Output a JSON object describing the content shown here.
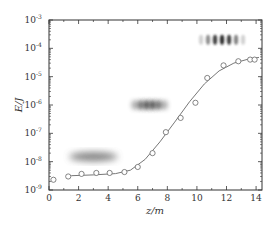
{
  "chart_data": {
    "type": "scatter",
    "title": "",
    "xlabel": "z/m",
    "ylabel": "E/J",
    "xlim": [
      0,
      14.4
    ],
    "ylim": [
      1e-09,
      0.001
    ],
    "yscale": "log",
    "grid": false,
    "legend": null,
    "x_ticks": [
      0,
      2,
      4,
      6,
      8,
      10,
      12,
      14
    ],
    "x_tick_labels": [
      "0",
      "2",
      "4",
      "6",
      "8",
      "10",
      "12",
      "14"
    ],
    "y_ticks": [
      1e-09,
      1e-08,
      1e-07,
      1e-06,
      1e-05,
      0.0001,
      0.001
    ],
    "y_tick_labels": [
      {
        "base": "10",
        "exp": "-9"
      },
      {
        "base": "10",
        "exp": "-8"
      },
      {
        "base": "10",
        "exp": "-7"
      },
      {
        "base": "10",
        "exp": "-6"
      },
      {
        "base": "10",
        "exp": "-5"
      },
      {
        "base": "10",
        "exp": "-4"
      },
      {
        "base": "10",
        "exp": "-3"
      }
    ],
    "series": [
      {
        "name": "measured",
        "style": "open-circle",
        "x": [
          0.3,
          1.3,
          2.2,
          3.2,
          4.1,
          5.1,
          6.0,
          7.0,
          7.9,
          8.9,
          9.9,
          10.7,
          11.8,
          12.8,
          13.6,
          13.9
        ],
        "y": [
          2.3e-09,
          3e-09,
          3.7e-09,
          4e-09,
          4e-09,
          4.3e-09,
          6.5e-09,
          2e-08,
          1.1e-07,
          3.5e-07,
          1.2e-06,
          9e-06,
          2.5e-05,
          3.5e-05,
          4e-05,
          4e-05
        ]
      },
      {
        "name": "simulation",
        "style": "line",
        "x": [
          1.5,
          3,
          4.5,
          5.5,
          6.5,
          7.5,
          8.5,
          9.5,
          10.5,
          11.5,
          12.5,
          13.5,
          14.2
        ],
        "y": [
          3.2e-09,
          3.4e-09,
          3.8e-09,
          5e-09,
          1.2e-08,
          5e-08,
          2.5e-07,
          1.3e-06,
          5.5e-06,
          1.6e-05,
          3e-05,
          4.2e-05,
          4.8e-05
        ]
      }
    ],
    "annotations": [
      {
        "type": "beam-profile-image",
        "description": "single blurred spot",
        "center_x": 3.0,
        "center_y": 1.5e-08
      },
      {
        "type": "beam-profile-image",
        "description": "blurred multi-spot (microbunched)",
        "center_x": 6.8,
        "center_y": 1e-06
      },
      {
        "type": "beam-profile-image",
        "description": "sharp multi-spot (microbunched)",
        "center_x": 11.7,
        "center_y": 0.0002
      }
    ]
  }
}
